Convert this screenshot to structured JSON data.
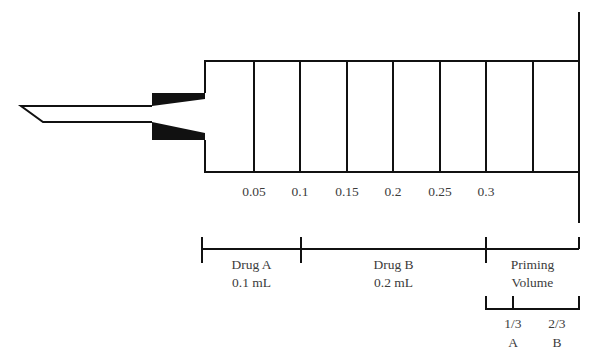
{
  "diagram": {
    "scale_ticks": [
      "0.05",
      "0.1",
      "0.15",
      "0.2",
      "0.25",
      "0.3"
    ],
    "segments": [
      {
        "name": "Drug A",
        "volume": "0.1 mL"
      },
      {
        "name": "Drug B",
        "volume": "0.2 mL"
      },
      {
        "name": "Priming",
        "volume": "Volume"
      }
    ],
    "priming_split": [
      {
        "fraction": "1/3",
        "drug": "A"
      },
      {
        "fraction": "2/3",
        "drug": "B"
      }
    ],
    "colors": {
      "line": "#111111",
      "text": "#3c3c3c",
      "background": "#ffffff"
    }
  }
}
